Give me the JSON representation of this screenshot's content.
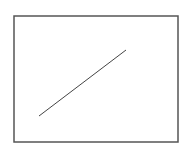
{
  "diagram": {
    "width": 187,
    "height": 153,
    "background": "#ffffff",
    "frame": {
      "x": 14,
      "y": 16,
      "width": 164,
      "height": 126,
      "stroke": "#555555",
      "stroke_width": 1.5
    },
    "segment": {
      "x1": 39,
      "y1": 116,
      "x2": 126,
      "y2": 50,
      "stroke": "#444444",
      "stroke_width": 1
    }
  }
}
